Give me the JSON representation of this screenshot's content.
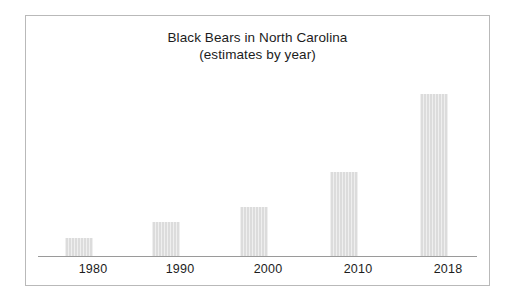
{
  "figure": {
    "background_color": "#ffffff",
    "frame_color": "#b9b9b9",
    "axis_color": "#9a9a9a",
    "bar_color": "#dcdcdc",
    "text_color": "#1c1c1c"
  },
  "chart_data": {
    "type": "bar",
    "title": "Black Bears in North Carolina",
    "subtitle": "(estimates by year)",
    "xlabel": "",
    "ylabel": "",
    "grid": false,
    "legend": false,
    "categories": [
      "1980",
      "1990",
      "2000",
      "2010",
      "2018"
    ],
    "values": [
      18,
      34,
      49,
      84,
      162
    ],
    "value_units": "relative bar height in pixels (no y-axis shown)",
    "ylim": [
      0,
      196
    ],
    "bars": [
      {
        "category": "1980",
        "height": 18,
        "left": 27,
        "width": 28
      },
      {
        "category": "1990",
        "height": 34,
        "left": 114,
        "width": 28
      },
      {
        "category": "2000",
        "height": 49,
        "left": 202,
        "width": 28
      },
      {
        "category": "2010",
        "height": 84,
        "left": 292,
        "width": 28
      },
      {
        "category": "2018",
        "height": 162,
        "left": 382,
        "width": 28
      }
    ],
    "tick_positions": [
      41,
      128,
      216,
      306,
      396
    ]
  }
}
